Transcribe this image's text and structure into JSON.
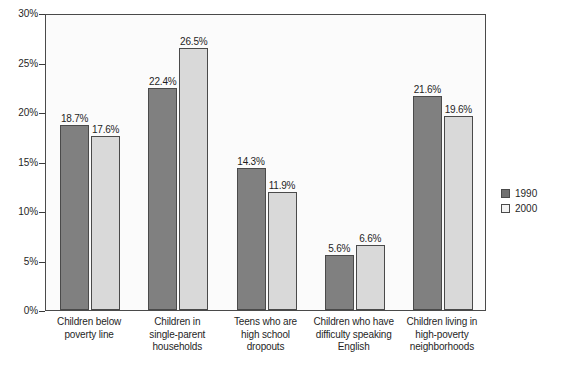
{
  "chart_data": {
    "type": "bar",
    "title": "",
    "subtitle": "",
    "xlabel": "",
    "ylabel": "",
    "ylim": [
      0,
      30
    ],
    "ytick_labels": [
      "0%",
      "5%",
      "10%",
      "15%",
      "20%",
      "25%",
      "30%"
    ],
    "ytick_values": [
      0,
      5,
      10,
      15,
      20,
      25,
      30
    ],
    "grid": false,
    "legend_position": "right",
    "categories": [
      "Children below poverty line",
      "Children in single-parent households",
      "Teens who are high school dropouts",
      "Children who have difficulty speaking English",
      "Children living in high-poverty neighborhoods"
    ],
    "category_lines": [
      [
        "Children below",
        "poverty line"
      ],
      [
        "Children in",
        "single-parent",
        "households"
      ],
      [
        "Teens who are",
        "high school",
        "dropouts"
      ],
      [
        "Children who have",
        "difficulty speaking",
        "English"
      ],
      [
        "Children living in",
        "high-poverty",
        "neighborhoods"
      ]
    ],
    "series": [
      {
        "name": "1990",
        "color": "#808080",
        "values": [
          18.7,
          22.4,
          14.3,
          5.6,
          21.6
        ],
        "labels": [
          "18.7%",
          "22.4%",
          "14.3%",
          "5.6%",
          "21.6%"
        ]
      },
      {
        "name": "2000",
        "color": "#d9d9d9",
        "values": [
          17.6,
          26.5,
          11.9,
          6.6,
          19.6
        ],
        "labels": [
          "17.6%",
          "26.5%",
          "11.9%",
          "6.6%",
          "19.6%"
        ]
      }
    ]
  },
  "legend": {
    "items": [
      {
        "label": "1990",
        "swatch": "dark-swatch"
      },
      {
        "label": "2000",
        "swatch": "light-swatch"
      }
    ]
  }
}
